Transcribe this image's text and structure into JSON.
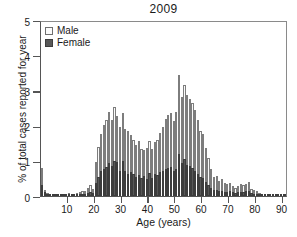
{
  "chart_data": {
    "type": "bar",
    "title": "2009",
    "xlabel": "Age (years)",
    "ylabel": "% of total cases reported for year",
    "xlim": [
      0,
      92
    ],
    "ylim": [
      0,
      5
    ],
    "yticks": [
      0,
      1,
      2,
      3,
      4,
      5
    ],
    "xticks": [
      10,
      20,
      30,
      40,
      50,
      60,
      70,
      80,
      90
    ],
    "grid": false,
    "stacked": true,
    "legend_position": "top-left",
    "legend": [
      "Male",
      "Female"
    ],
    "colors": {
      "male": "#fbfbfb",
      "female": "#585858",
      "outline": "#7d7d7d",
      "axis": "#555555"
    },
    "x": [
      0,
      1,
      2,
      3,
      4,
      5,
      6,
      7,
      8,
      9,
      10,
      11,
      12,
      13,
      14,
      15,
      16,
      17,
      18,
      19,
      20,
      21,
      22,
      23,
      24,
      25,
      26,
      27,
      28,
      29,
      30,
      31,
      32,
      33,
      34,
      35,
      36,
      37,
      38,
      39,
      40,
      41,
      42,
      43,
      44,
      45,
      46,
      47,
      48,
      49,
      50,
      51,
      52,
      53,
      54,
      55,
      56,
      57,
      58,
      59,
      60,
      61,
      62,
      63,
      64,
      65,
      66,
      67,
      68,
      69,
      70,
      71,
      72,
      73,
      74,
      75,
      76,
      77,
      78,
      79,
      80,
      81,
      82,
      83,
      84,
      85,
      86,
      87,
      88,
      89,
      90,
      91
    ],
    "series": [
      {
        "name": "Male",
        "values": [
          0.5,
          0.07,
          0.04,
          0.03,
          0.04,
          0.04,
          0.03,
          0.03,
          0.04,
          0.03,
          0.05,
          0.04,
          0.03,
          0.05,
          0.06,
          0.1,
          0.09,
          0.14,
          0.2,
          0.12,
          0.6,
          0.85,
          1.05,
          1.25,
          1.35,
          1.45,
          1.3,
          1.52,
          1.3,
          1.25,
          1.35,
          1.2,
          1.22,
          1.05,
          0.98,
          0.9,
          0.95,
          0.85,
          0.72,
          0.88,
          0.9,
          0.85,
          0.92,
          1.0,
          1.1,
          1.25,
          1.4,
          1.5,
          1.55,
          1.42,
          1.6,
          2.25,
          1.85,
          2.1,
          2.0,
          1.9,
          1.85,
          1.75,
          1.55,
          1.3,
          1.25,
          0.95,
          0.78,
          0.55,
          0.38,
          0.4,
          0.3,
          0.32,
          0.25,
          0.22,
          0.24,
          0.18,
          0.15,
          0.18,
          0.22,
          0.2,
          0.22,
          0.25,
          0.12,
          0.1,
          0.08,
          0.05,
          0.03,
          0.03,
          0.02,
          0.02,
          0.02,
          0.01,
          0.01,
          0.01,
          0.03,
          0.01
        ]
      },
      {
        "name": "Female",
        "values": [
          0.3,
          0.1,
          0.04,
          0.03,
          0.03,
          0.03,
          0.03,
          0.03,
          0.03,
          0.03,
          0.03,
          0.03,
          0.03,
          0.03,
          0.04,
          0.05,
          0.06,
          0.08,
          0.1,
          0.08,
          0.38,
          0.55,
          0.7,
          0.78,
          0.82,
          0.95,
          0.85,
          1.0,
          0.98,
          0.72,
          1.0,
          0.7,
          0.62,
          0.68,
          0.62,
          0.55,
          0.6,
          0.5,
          0.58,
          0.48,
          0.65,
          0.5,
          0.62,
          0.6,
          0.68,
          0.7,
          0.78,
          0.8,
          0.82,
          0.72,
          0.78,
          1.2,
          0.95,
          1.05,
          0.88,
          0.85,
          0.8,
          0.7,
          0.62,
          0.55,
          0.52,
          0.4,
          0.3,
          0.22,
          0.16,
          0.18,
          0.14,
          0.15,
          0.12,
          0.12,
          0.14,
          0.1,
          0.09,
          0.1,
          0.12,
          0.12,
          0.13,
          0.15,
          0.08,
          0.07,
          0.05,
          0.03,
          0.02,
          0.02,
          0.01,
          0.01,
          0.01,
          0.01,
          0.01,
          0.01,
          0.02,
          0.01
        ]
      }
    ],
    "totals_note": "Bars are stacked: Female (dark) at bottom, Male (light) on top; peak total ~3.45 at age 51."
  }
}
